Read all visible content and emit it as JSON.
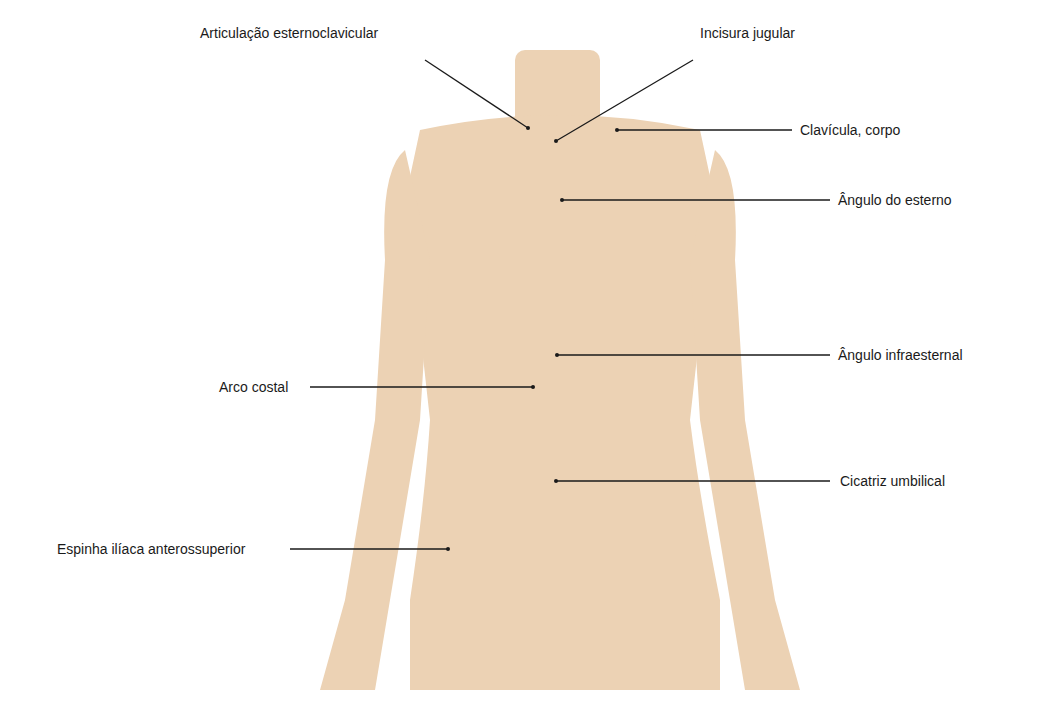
{
  "figure": {
    "type": "anatomical-surface-landmarks",
    "view": "anterior trunk",
    "silhouette_color": "#ecd2b4",
    "leader_color": "#1a1a1a"
  },
  "labels": [
    {
      "id": "articulacao-esternoclavicular",
      "text": "Articulação esternoclavicular",
      "side": "left",
      "tx": 200,
      "ty": 25,
      "x1": 425,
      "y1": 60,
      "x2": 528,
      "y2": 128
    },
    {
      "id": "incisura-jugular",
      "text": "Incisura jugular",
      "side": "right",
      "tx": 700,
      "ty": 25,
      "x1": 693,
      "y1": 60,
      "x2": 556,
      "y2": 141
    },
    {
      "id": "clavicula-corpo",
      "text": "Clavícula, corpo",
      "side": "right",
      "tx": 800,
      "ty": 122,
      "x1": 792,
      "y1": 130,
      "x2": 617,
      "y2": 130
    },
    {
      "id": "angulo-do-esterno",
      "text": "Ângulo do esterno",
      "side": "right",
      "tx": 838,
      "ty": 192,
      "x1": 830,
      "y1": 200,
      "x2": 562,
      "y2": 200
    },
    {
      "id": "angulo-infraesternal",
      "text": "Ângulo infraesternal",
      "side": "right",
      "tx": 838,
      "ty": 347,
      "x1": 830,
      "y1": 355,
      "x2": 557,
      "y2": 355
    },
    {
      "id": "arco-costal",
      "text": "Arco costal",
      "side": "left",
      "tx": 219,
      "ty": 379,
      "x1": 310,
      "y1": 387,
      "x2": 533,
      "y2": 387
    },
    {
      "id": "cicatriz-umbilical",
      "text": "Cicatriz umbilical",
      "side": "right",
      "tx": 840,
      "ty": 473,
      "x1": 830,
      "y1": 481,
      "x2": 556,
      "y2": 481
    },
    {
      "id": "espinha-iliaca-anterossuperior",
      "text": "Espinha ilíaca anterossuperior",
      "side": "left",
      "tx": 57,
      "ty": 541,
      "x1": 290,
      "y1": 549,
      "x2": 448,
      "y2": 549
    }
  ]
}
